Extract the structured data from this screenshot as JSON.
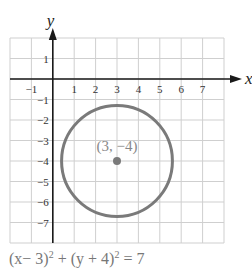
{
  "chart_data": {
    "type": "scatter",
    "title": "",
    "xlabel": "x",
    "ylabel": "y",
    "xlim": [
      -2,
      8
    ],
    "ylim": [
      -8,
      2
    ],
    "grid": true,
    "x_ticks": [
      -1,
      1,
      2,
      3,
      4,
      5,
      6,
      7
    ],
    "x_tick_labels": [
      "−1",
      "1",
      "2",
      "3",
      "4",
      "5",
      "6",
      "7"
    ],
    "y_ticks": [
      1,
      -1,
      -2,
      -3,
      -4,
      -5,
      -6,
      -7
    ],
    "y_tick_labels": [
      "1",
      "−1",
      "−2",
      "−3",
      "−4",
      "−5",
      "−6",
      "−7"
    ],
    "circle": {
      "center": [
        3,
        -4
      ],
      "radius_squared": 7,
      "color": "#7a7a7a"
    },
    "points": [
      {
        "x": 3,
        "y": -4,
        "label": "(3, −4)",
        "color": "#7a7a7a"
      }
    ],
    "equation": {
      "left_a": "(x− 3)",
      "exp_a": "2",
      "plus": " + (y + 4)",
      "exp_b": "2",
      "right": " = 7"
    }
  }
}
